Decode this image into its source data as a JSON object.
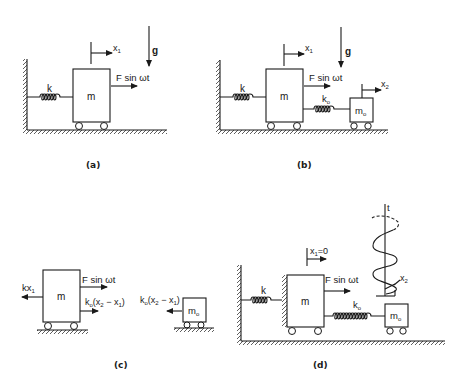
{
  "figure": {
    "panels": [
      {
        "id": "a",
        "caption": "(a)",
        "mass_label": "m",
        "spring_label": "k",
        "displacement_label": "x",
        "displacement_sub": "1",
        "force_label": "F sin ωt",
        "gravity_label": "g"
      },
      {
        "id": "b",
        "caption": "(b)",
        "mass_label": "m",
        "spring_label": "k",
        "absorber_mass_label": "m",
        "absorber_mass_sub": "o",
        "absorber_spring_label": "k",
        "absorber_spring_sub": "o",
        "displacement_label": "x",
        "displacement_sub": "1",
        "absorber_displacement_label": "x",
        "absorber_displacement_sub": "2",
        "force_label": "F sin ωt",
        "gravity_label": "g"
      },
      {
        "id": "c",
        "caption": "(c)",
        "mass_label": "m",
        "absorber_mass_label": "m",
        "absorber_mass_sub": "o",
        "spring_force_label": "kx",
        "spring_force_sub": "1",
        "force_label": "F sin ωt",
        "coupling_force_main": "k",
        "coupling_force_sub": "o",
        "coupling_force_rest": "(x",
        "coupling_force_x2sub": "2",
        "coupling_force_minus": " − x",
        "coupling_force_x1sub": "1",
        "coupling_force_close": ")"
      },
      {
        "id": "d",
        "caption": "(d)",
        "mass_label": "m",
        "spring_label": "k",
        "absorber_mass_label": "m",
        "absorber_mass_sub": "o",
        "absorber_spring_label": "k",
        "absorber_spring_sub": "o",
        "displacement_label": "x",
        "displacement_sub": "1",
        "displacement_value": "=0",
        "force_label": "F sin ωt",
        "time_axis_label": "t",
        "absorber_displacement_label": "x",
        "absorber_displacement_sub": "2"
      }
    ]
  }
}
